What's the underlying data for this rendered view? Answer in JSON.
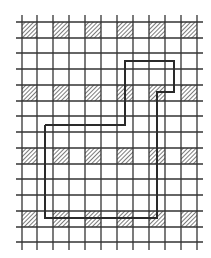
{
  "diagram": {
    "type": "grid-with-path",
    "colors": {
      "background": "#ffffff",
      "grid_line": "#333333",
      "hatch": "#444444",
      "path": "#2a2a2a"
    },
    "grid": {
      "vertical_x": [
        22,
        37,
        53,
        69,
        85,
        101,
        117,
        133,
        149,
        165,
        181,
        197
      ],
      "horizontal_y": [
        22,
        38,
        53,
        69,
        85,
        101,
        116,
        132,
        148,
        164,
        179,
        195,
        211,
        227,
        242
      ],
      "x_extent": [
        16,
        203
      ],
      "y_extent": [
        15,
        250
      ]
    },
    "hatched_cells": {
      "columns": [
        [
          22,
          37
        ],
        [
          53,
          69
        ],
        [
          85,
          101
        ],
        [
          117,
          133
        ],
        [
          149,
          165
        ],
        [
          181,
          197
        ]
      ],
      "rows": [
        [
          22,
          38
        ],
        [
          85,
          101
        ],
        [
          148,
          164
        ],
        [
          211,
          227
        ]
      ]
    },
    "path": {
      "points": [
        [
          45,
          125
        ],
        [
          125,
          125
        ],
        [
          125,
          61
        ],
        [
          174,
          61
        ],
        [
          174,
          92
        ],
        [
          157,
          92
        ],
        [
          157,
          218
        ],
        [
          45,
          218
        ],
        [
          45,
          125
        ]
      ]
    }
  }
}
